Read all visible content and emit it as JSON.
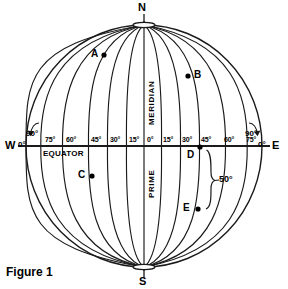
{
  "figure": {
    "caption": "Figure 1",
    "type": "globe-graticule-diagram"
  },
  "poles": {
    "north": "N",
    "south": "S"
  },
  "cardinals": {
    "west": "W",
    "east": "E"
  },
  "edge_degrees": {
    "west": "0°",
    "east": "0°"
  },
  "corner_degrees": {
    "west_90": "90°",
    "east_90": "90°"
  },
  "axis_labels": {
    "equator": "EQUATOR",
    "meridian": "MERIDIAN",
    "prime": "PRIME"
  },
  "longitude_ticks": {
    "west": [
      "75°",
      "60°",
      "45°",
      "30°",
      "15°"
    ],
    "center": "0°",
    "east": [
      "15°",
      "30°",
      "45°",
      "60°",
      "75°"
    ]
  },
  "points": [
    {
      "label": "A",
      "lon": "-38",
      "lat": "42",
      "label_side": "left"
    },
    {
      "label": "B",
      "lon": "32",
      "lat": "33",
      "label_side": "right"
    },
    {
      "label": "C",
      "lon": "-40",
      "lat": "-16",
      "label_side": "left"
    },
    {
      "label": "D",
      "lon": "45",
      "lat": "0",
      "label_side": "left"
    },
    {
      "label": "E",
      "lon": "42",
      "lat": "-50",
      "label_side": "left"
    }
  ],
  "annotations": {
    "arc_angle": "50°"
  },
  "colors": {
    "stroke": "#1a1a1a",
    "background": "#ffffff",
    "text": "#000000"
  },
  "geometry": {
    "center_x": 144,
    "center_y": 146,
    "radius_x": 118,
    "radius_y": 121
  }
}
